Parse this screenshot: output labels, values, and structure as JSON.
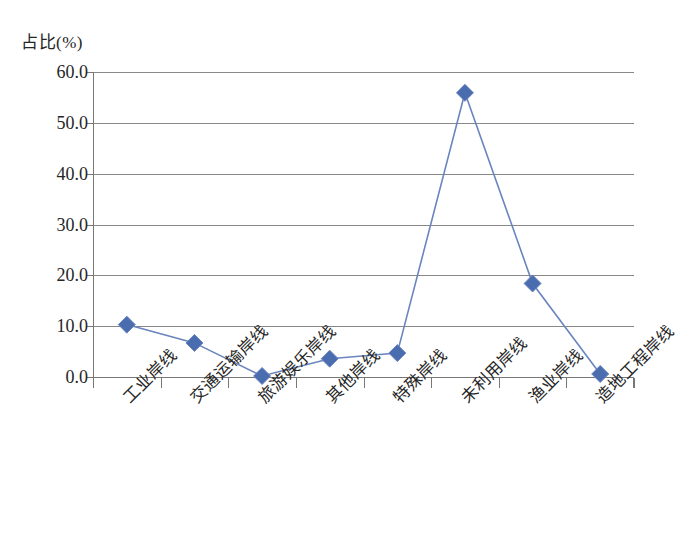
{
  "chart_data": {
    "type": "line",
    "title": "",
    "subtitle": "",
    "xlabel": "",
    "ylabel": "占比(%)",
    "categories": [
      "工业岸线",
      "交通运输岸线",
      "旅游娱乐岸线",
      "其他岸线",
      "特殊岸线",
      "未利用岸线",
      "渔业岸线",
      "造地工程岸线"
    ],
    "values": [
      10.3,
      6.7,
      0.2,
      3.6,
      4.7,
      55.9,
      18.4,
      0.6
    ],
    "series": [
      {
        "name": "占比(%)",
        "values": [
          10.3,
          6.7,
          0.2,
          3.6,
          4.7,
          55.9,
          18.4,
          0.6
        ]
      }
    ],
    "ylim": [
      0,
      60
    ],
    "ytick_labels": [
      "0.0",
      "10.0",
      "20.0",
      "30.0",
      "40.0",
      "50.0",
      "60.0"
    ],
    "ytick_values": [
      0,
      10,
      20,
      30,
      40,
      50,
      60
    ],
    "grid": "horizontal",
    "legend": "none",
    "marker": "diamond",
    "colors": {
      "series_line": "#6A85BE",
      "marker_fill": "#4A6DB0",
      "gridline": "#888888",
      "axis": "#777777",
      "text": "#262626"
    }
  }
}
